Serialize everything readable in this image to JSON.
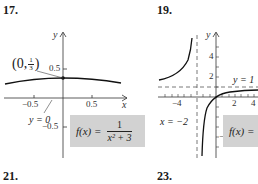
{
  "problems": [
    {
      "number": "17.",
      "function": "f(x) = 1/(x^2 + 3)",
      "formula": {
        "lhs": "f(x) =",
        "num": "1",
        "den": "x² + 3"
      },
      "point_label": {
        "open": "(0,",
        "num": "1",
        "den": "3",
        "close": ")"
      },
      "asymptote_label": "y = 0",
      "axis_labels": {
        "x": "x",
        "y": "y"
      },
      "x_ticks": [
        "−0.5",
        "0.5"
      ],
      "y_ticks": [
        "0.5",
        "−0.5"
      ]
    },
    {
      "number": "19.",
      "formula": {
        "lhs": "f(x) ="
      },
      "vertical_asymptote_label": "x = −2",
      "horizontal_asymptote_label": "y = 1",
      "axis_labels": {
        "y": "y"
      },
      "x_ticks": [
        "−4",
        "2",
        "4"
      ],
      "y_ticks": [
        "4",
        "2",
        "−4"
      ]
    },
    {
      "number": "21."
    },
    {
      "number": "23."
    }
  ],
  "colors": {
    "formula_box": "#d2d2d2",
    "ink": "#1a1a1a",
    "dashed": "#555555"
  }
}
